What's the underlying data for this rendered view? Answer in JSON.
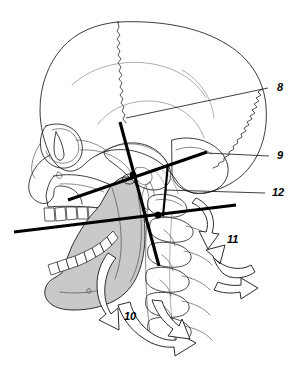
{
  "figure": {
    "width": 296,
    "height": 367,
    "background_color": "#ffffff",
    "line_color": "#000000",
    "mandible_fill_color": "#c9c9c9",
    "bone_outline_color": "#1a1a1a"
  },
  "labels": [
    {
      "id": "label-8",
      "text": "8",
      "x": 277,
      "y": 91,
      "leader": {
        "x1": 126,
        "y1": 118,
        "x2": 268,
        "y2": 88
      }
    },
    {
      "id": "label-9",
      "text": "9",
      "x": 277,
      "y": 159,
      "leader": {
        "x1": 206,
        "y1": 153,
        "x2": 269,
        "y2": 156
      }
    },
    {
      "id": "label-12",
      "text": "12",
      "x": 272,
      "y": 196,
      "leader": {
        "x1": 166,
        "y1": 190,
        "x2": 265,
        "y2": 193
      }
    },
    {
      "id": "label-11",
      "text": "11",
      "x": 227,
      "y": 243,
      "leader": null
    },
    {
      "id": "label-10",
      "text": "10",
      "x": 124,
      "y": 320,
      "leader": null
    }
  ],
  "axes": [
    {
      "id": "axis-occlusal-plane",
      "name": "occlusal-plane-line",
      "x1": 14,
      "y1": 232,
      "x2": 236,
      "y2": 205
    },
    {
      "id": "axis-upper-oblique",
      "name": "upper-oblique-line",
      "x1": 68,
      "y1": 200,
      "x2": 207,
      "y2": 152
    },
    {
      "id": "axis-vertical-main",
      "name": "main-vertical-axis-line",
      "x1": 120,
      "y1": 122,
      "x2": 159,
      "y2": 266
    },
    {
      "id": "axis-short-vertical",
      "name": "short-vertical-axis-line",
      "x1": 168,
      "y1": 164,
      "x2": 163,
      "y2": 216
    }
  ],
  "pivots": [
    {
      "id": "pivot-upper",
      "name": "upper-rotation-center",
      "cx": 133,
      "cy": 175,
      "r": 3.2
    },
    {
      "id": "pivot-lower",
      "name": "lower-rotation-center",
      "cx": 158,
      "cy": 215,
      "r": 3.2
    }
  ],
  "anatomy": {
    "cranium": "cranial-vault",
    "suture": "coronal-suture",
    "orbit": "eye-socket",
    "maxilla": "upper-jaw",
    "mandible": "lower-jaw-shaded",
    "spine": "cervical-vertebrae",
    "arrows": "motion-direction-arrows"
  }
}
